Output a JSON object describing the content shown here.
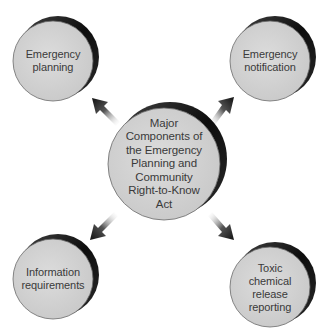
{
  "diagram": {
    "type": "hub-and-spoke",
    "colors": {
      "background": "#ffffff",
      "disk_face": "#d4d4d4",
      "disk_rim": "#111111",
      "arrow": "#1a1a1a",
      "text": "#3a3a3a"
    },
    "center": {
      "lines": [
        "Major",
        "Components of",
        "the Emergency",
        "Planning and",
        "Community",
        "Right-to-Know",
        "Act"
      ]
    },
    "nodes": [
      {
        "id": "top-left",
        "lines": [
          "Emergency",
          "planning"
        ]
      },
      {
        "id": "top-right",
        "lines": [
          "Emergency",
          "notification"
        ]
      },
      {
        "id": "bottom-left",
        "lines": [
          "Information",
          "requirements"
        ]
      },
      {
        "id": "bottom-right",
        "lines": [
          "Toxic",
          "chemical",
          "release",
          "reporting"
        ]
      }
    ],
    "edges": [
      {
        "from": "center",
        "to": "top-left"
      },
      {
        "from": "center",
        "to": "top-right"
      },
      {
        "from": "center",
        "to": "bottom-left"
      },
      {
        "from": "center",
        "to": "bottom-right"
      }
    ]
  }
}
